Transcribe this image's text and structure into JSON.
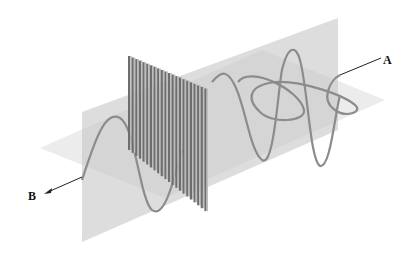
{
  "diagram": {
    "labels": {
      "a": "A",
      "b": "B"
    },
    "colors": {
      "background": "#ffffff",
      "vertical_plane": "#c8c8c8",
      "horizontal_plane": "#d9d9d9",
      "wave": "#8a8a8a",
      "grating_dark": "#6e6e6e",
      "grating_light": "#bdbdbd",
      "arrow": "#222222"
    },
    "components": [
      "unpolarized-wave",
      "vertical-plane",
      "horizontal-plane",
      "polarizer-grating",
      "polarized-wave"
    ]
  }
}
